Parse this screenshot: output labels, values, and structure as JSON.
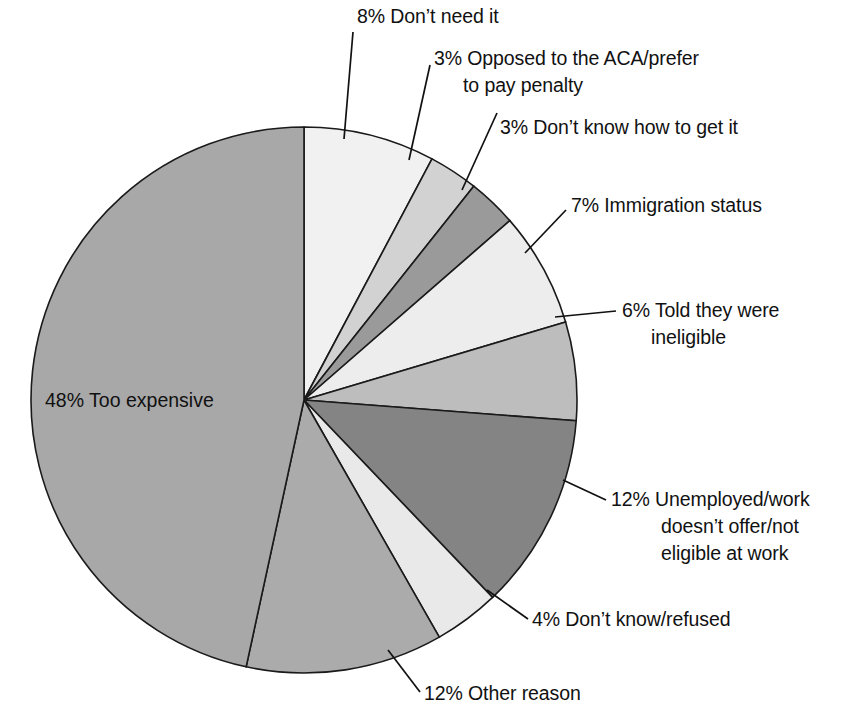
{
  "chart_data": {
    "type": "pie",
    "title": "",
    "subtitle": "",
    "xlabel": "",
    "ylabel": "",
    "units": "percent",
    "legend_position": "none",
    "grid": false,
    "start_angle_deg": 0,
    "direction": "clockwise",
    "categories": [
      "Don't need it",
      "Opposed to the ACA/prefer to pay penalty",
      "Don't know how to get it",
      "Immigration status",
      "Told they were ineligible",
      "Unemployed/work doesn't offer/not eligible at work",
      "Don't know/refused",
      "Other reason",
      "Too expensive"
    ],
    "values": [
      8,
      3,
      3,
      7,
      6,
      12,
      4,
      12,
      48
    ],
    "colors": [
      "#f1f1f1",
      "#d2d2d2",
      "#9a9a9a",
      "#ededed",
      "#bdbdbd",
      "#848484",
      "#e9e9e9",
      "#ababab",
      "#a8a8a8"
    ],
    "slices": [
      {
        "label": "8% Don't need it",
        "percent": 8,
        "name": "Don't need it",
        "color": "#f1f1f1",
        "text_lines": [
          "8% Don’t need it"
        ]
      },
      {
        "label": "3% Opposed to the ACA/prefer to pay penalty",
        "percent": 3,
        "name": "Opposed to the ACA/prefer to pay penalty",
        "color": "#d2d2d2",
        "text_lines": [
          "3% Opposed to the ACA/prefer",
          "to pay penalty"
        ]
      },
      {
        "label": "3% Don't know how to get it",
        "percent": 3,
        "name": "Don't know how to get it",
        "color": "#9a9a9a",
        "text_lines": [
          "3% Don’t know how to get it"
        ]
      },
      {
        "label": "7% Immigration status",
        "percent": 7,
        "name": "Immigration status",
        "color": "#ededed",
        "text_lines": [
          "7% Immigration status"
        ]
      },
      {
        "label": "6% Told they were ineligible",
        "percent": 6,
        "name": "Told they were ineligible",
        "color": "#bdbdbd",
        "text_lines": [
          "6% Told they were",
          "ineligible"
        ]
      },
      {
        "label": "12% Unemployed/work doesn't offer/not eligible at work",
        "percent": 12,
        "name": "Unemployed/work doesn't offer/not eligible at work",
        "color": "#848484",
        "text_lines": [
          "12% Unemployed/work",
          "doesn’t offer/not",
          "eligible at work"
        ]
      },
      {
        "label": "4% Don't know/refused",
        "percent": 4,
        "name": "Don't know/refused",
        "color": "#e9e9e9",
        "text_lines": [
          "4% Don’t know/refused"
        ]
      },
      {
        "label": "12% Other reason",
        "percent": 12,
        "name": "Other reason",
        "color": "#ababab",
        "text_lines": [
          "12% Other reason"
        ]
      },
      {
        "label": "48% Too expensive",
        "percent": 48,
        "name": "Too expensive",
        "color": "#a8a8a8",
        "text_lines": [
          "48% Too expensive"
        ]
      }
    ]
  },
  "labels": {
    "dont_need_it": "8% Don’t need it",
    "opposed_l1": "3% Opposed to the ACA/prefer",
    "opposed_l2": "to pay penalty",
    "dont_know_how": "3% Don’t know how to get it",
    "immigration": "7% Immigration status",
    "ineligible_l1": "6% Told they were",
    "ineligible_l2": "ineligible",
    "unemployed_l1": "12% Unemployed/work",
    "unemployed_l2": "doesn’t offer/not",
    "unemployed_l3": "eligible at work",
    "dk_refused": "4% Don’t know/refused",
    "other_reason": "12% Other reason",
    "too_expensive": "48% Too expensive"
  },
  "theme": {
    "background": "#ffffff",
    "outline": "#1a1a1a",
    "text": "#111111"
  }
}
